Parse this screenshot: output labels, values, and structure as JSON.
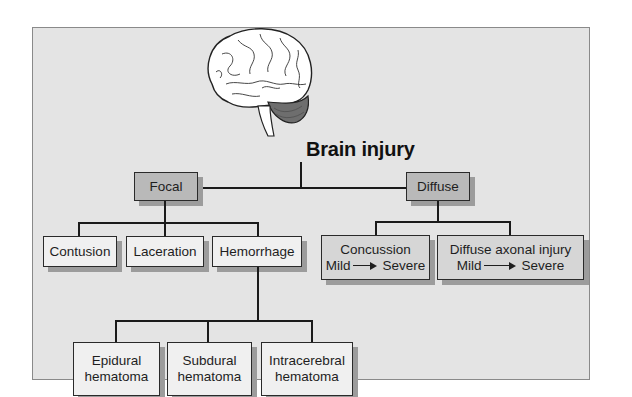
{
  "diagram": {
    "title": "Brain injury",
    "icon": "brain-icon",
    "colors": {
      "panel_bg": "#e4e4e4",
      "category_box": "#b9b9b9",
      "leaf_box": "#f0f0f0",
      "line": "#1a1a1a",
      "shadow": "#9c9c9c"
    },
    "categories": [
      {
        "label": "Focal",
        "children": [
          {
            "label": "Contusion"
          },
          {
            "label": "Laceration"
          },
          {
            "label": "Hemorrhage",
            "children": [
              {
                "line1": "Epidural",
                "line2": "hematoma"
              },
              {
                "line1": "Subdural",
                "line2": "hematoma"
              },
              {
                "line1": "Intracerebral",
                "line2": "hematoma"
              }
            ]
          }
        ]
      },
      {
        "label": "Diffuse",
        "children": [
          {
            "label": "Concussion",
            "scale_from": "Mild",
            "scale_to": "Severe"
          },
          {
            "label": "Diffuse axonal injury",
            "scale_from": "Mild",
            "scale_to": "Severe"
          }
        ]
      }
    ]
  }
}
